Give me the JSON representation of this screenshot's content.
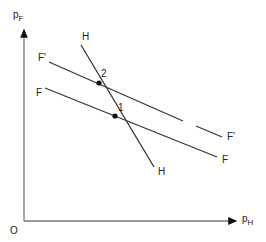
{
  "axes": {
    "y_label": "p",
    "y_label_sub": "F",
    "x_label": "p",
    "x_label_sub": "H",
    "origin_label": "O"
  },
  "curves": {
    "H": {
      "label_top": "H",
      "label_bottom": "H"
    },
    "F_prime": {
      "label_left": "F'",
      "label_right": "F'",
      "style": "dashed-segment"
    },
    "F": {
      "label_left": "F",
      "label_right": "F"
    }
  },
  "points": [
    {
      "label": "2",
      "description": "intersection of H and F'"
    },
    {
      "label": "1",
      "description": "intersection of H and F"
    }
  ],
  "colors": {
    "line": "#333333",
    "axis": "#666666",
    "background": "#ffffff"
  }
}
